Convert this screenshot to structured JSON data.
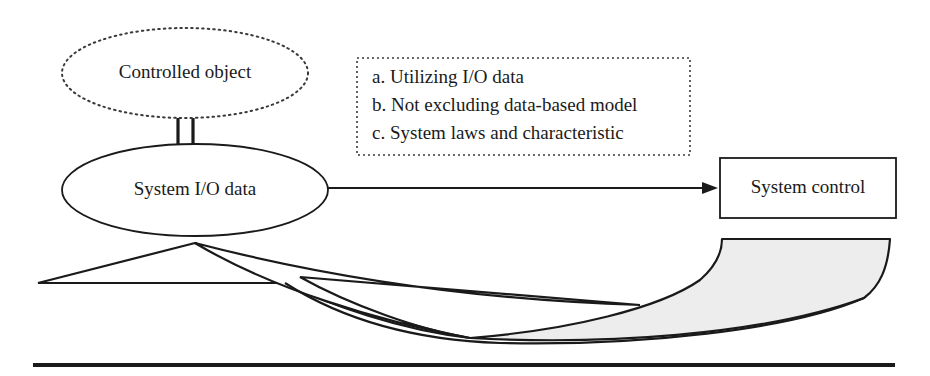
{
  "diagram": {
    "title_text": "",
    "nodes": {
      "controlled_object": {
        "label": "Controlled object",
        "shape": "ellipse",
        "border_style": "dotted",
        "cx": 185,
        "cy": 73,
        "rx": 123,
        "ry": 45
      },
      "system_io_data": {
        "label": "System I/O data",
        "shape": "ellipse",
        "border_style": "solid",
        "cx": 195,
        "cy": 190,
        "rx": 133,
        "ry": 46
      },
      "system_control": {
        "label": "System control",
        "shape": "rectangle",
        "border_style": "solid",
        "x": 720,
        "y": 158,
        "width": 176,
        "height": 60
      }
    },
    "note_box": {
      "border_style": "dotted",
      "x": 357,
      "y": 58,
      "width": 333,
      "height": 97,
      "items": [
        "a. Utilizing I/O data",
        "b. Not excluding data-based model",
        "c. System laws and characteristic"
      ]
    },
    "connectors": {
      "double_link": {
        "name": "controlled-object-to-system-io-link",
        "style": "double-vertical-line",
        "x1": 178,
        "x2": 192,
        "y_top": 118,
        "y_bottom": 150
      },
      "arrow_to_control": {
        "name": "system-io-to-system-control-arrow",
        "style": "solid-arrow",
        "x1": 328,
        "y1": 188,
        "x2": 718,
        "y2": 188
      }
    },
    "ribbon": {
      "name": "curved-feedback-ribbon",
      "fill_left": "#ffffff",
      "fill_right": "#ededed",
      "stroke": "#1a1a1a"
    },
    "baseline_rule": {
      "name": "bottom-rule",
      "x1": 33,
      "x2": 895,
      "y": 365,
      "thickness": 4,
      "color": "#1a1a1a"
    },
    "colors": {
      "stroke": "#1a1a1a",
      "text": "#1a1a1a",
      "background": "#ffffff",
      "gray_fill": "#ededed"
    }
  }
}
